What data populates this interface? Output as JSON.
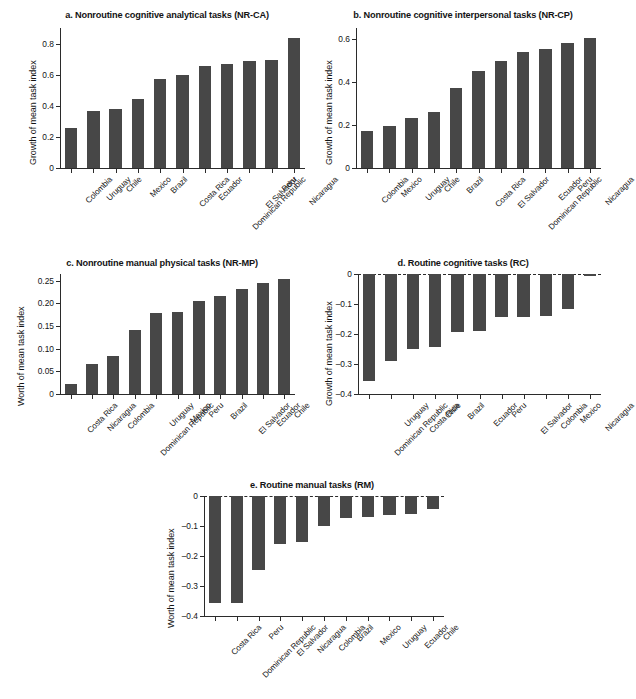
{
  "figure": {
    "background": "#ffffff",
    "bar_color": "#474747",
    "axis_color": "#2b2b2b"
  },
  "chart_data": [
    {
      "panel": "a",
      "type": "bar",
      "title": "a. Nonroutine cognitive analytical tasks (NR-CA)",
      "xlabel": "",
      "ylabel": "Growth of mean task index",
      "ylim": [
        0,
        0.9
      ],
      "yticks": [
        0,
        0.2,
        0.4,
        0.6,
        0.8
      ],
      "ytick_labels": [
        "0",
        "0.2",
        "0.4",
        "0.6",
        "0.8"
      ],
      "grid": false,
      "legend": "none",
      "categories": [
        "Colombia",
        "Uruguay",
        "Chile",
        "Mexico",
        "Brazil",
        "Costa Rica",
        "Ecuador",
        "Dominican Republic",
        "El Salvador",
        "Peru",
        "Nicaragua"
      ],
      "values": [
        0.255,
        0.365,
        0.378,
        0.445,
        0.573,
        0.598,
        0.658,
        0.667,
        0.688,
        0.697,
        0.838
      ]
    },
    {
      "panel": "b",
      "type": "bar",
      "title": "b.  Nonroutine cognitive interpersonal tasks (NR-CP)",
      "xlabel": "",
      "ylabel": "Growth of mean task index",
      "ylim": [
        0,
        0.65
      ],
      "yticks": [
        0,
        0.2,
        0.4,
        0.6
      ],
      "ytick_labels": [
        "0",
        "0.2",
        "0.4",
        "0.6"
      ],
      "grid": false,
      "legend": "none",
      "categories": [
        "Colombia",
        "Mexico",
        "Uruguay",
        "Chile",
        "Brazil",
        "Costa Rica",
        "El Salvador",
        "Dominican Republic",
        "Ecuador",
        "Peru",
        "Nicaragua"
      ],
      "values": [
        0.171,
        0.194,
        0.234,
        0.259,
        0.373,
        0.451,
        0.495,
        0.538,
        0.554,
        0.581,
        0.603
      ]
    },
    {
      "panel": "c",
      "type": "bar",
      "title": "c. Nonroutine manual physical tasks (NR-MP)",
      "xlabel": "",
      "ylabel": "Worth of mean task index",
      "ylim": [
        0,
        0.265
      ],
      "yticks": [
        0,
        0.05,
        0.1,
        0.15,
        0.2,
        0.25
      ],
      "ytick_labels": [
        "0",
        "0.05",
        "0.10",
        "0.15",
        "0.20",
        "0.25"
      ],
      "grid": false,
      "legend": "none",
      "categories": [
        "Costa Rica",
        "Nicaragua",
        "Colombia",
        "Dominican Republic",
        "Uruguay",
        "Mexico",
        "Peru",
        "Brazil",
        "El Salvador",
        "Ecuador",
        "Chile"
      ],
      "values": [
        0.022,
        0.066,
        0.083,
        0.142,
        0.179,
        0.182,
        0.205,
        0.216,
        0.231,
        0.246,
        0.255
      ]
    },
    {
      "panel": "d",
      "type": "bar",
      "title": "d. Routine cognitive tasks (RC)",
      "xlabel": "",
      "ylabel": "Growth of mean task index",
      "ylim": [
        -0.4,
        0.0
      ],
      "yticks": [
        0,
        -0.1,
        -0.2,
        -0.3,
        -0.4
      ],
      "ytick_labels": [
        "0",
        "–0.1",
        "–0.2",
        "–0.3",
        "–0.4"
      ],
      "grid": false,
      "legend": "none",
      "categories": [
        "Dominican Republic",
        "Uruguay",
        "Costa Rica",
        "Chile",
        "Brazil",
        "Ecuador",
        "Peru",
        "El Salvador",
        "Colombia",
        "Mexico",
        "Nicaragua"
      ],
      "values": [
        -0.355,
        -0.289,
        -0.251,
        -0.244,
        -0.192,
        -0.191,
        -0.143,
        -0.142,
        -0.141,
        -0.115,
        -0.006
      ]
    },
    {
      "panel": "e",
      "type": "bar",
      "title": "e. Routine manual tasks (RM)",
      "xlabel": "",
      "ylabel": "Worth of mean task index",
      "ylim": [
        -0.4,
        0.0
      ],
      "yticks": [
        0,
        -0.1,
        -0.2,
        -0.3,
        -0.4
      ],
      "ytick_labels": [
        "0",
        "–0.1",
        "–0.2",
        "–0.3",
        "–0.4"
      ],
      "grid": false,
      "legend": "none",
      "categories": [
        "Costa Rica",
        "Dominican Republic",
        "Peru",
        "El Salvador",
        "Nicaragua",
        "Colombia",
        "Brazil",
        "Mexico",
        "Uruguay",
        "Ecuador",
        "Chile"
      ],
      "values": [
        -0.355,
        -0.355,
        -0.247,
        -0.159,
        -0.152,
        -0.099,
        -0.072,
        -0.071,
        -0.062,
        -0.061,
        -0.044
      ]
    }
  ]
}
